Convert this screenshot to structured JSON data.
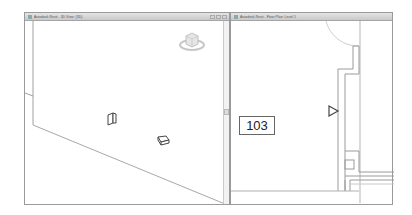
{
  "windows": [
    {
      "id": "3d-view",
      "title": "Autodesk Revit - 3D View: {3D}",
      "controls": [
        "minimize",
        "restore",
        "close"
      ],
      "viewcube_icon": "viewcube-icon",
      "objects": [
        "door-object",
        "door-object"
      ]
    },
    {
      "id": "floor-plan",
      "title": "Autodesk Revit - Floor Plan: Level 1",
      "room_tag": "103",
      "marker_icon": "section-arrow-icon"
    }
  ],
  "colors": {
    "border": "#9a9a9a",
    "line": "#9f9f9f",
    "titlebar": "#d4d4d4"
  }
}
